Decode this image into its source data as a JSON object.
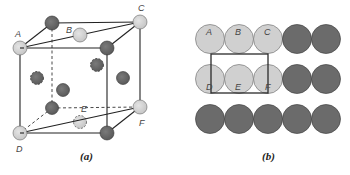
{
  "figure": {
    "panels": [
      {
        "id": "a",
        "caption": "(a)",
        "description": "Face-centered cubic unit cell with a diagonal plane through atoms A, B, C, D, E, F",
        "atom_labels": [
          "A",
          "B",
          "C",
          "D",
          "E",
          "F"
        ]
      },
      {
        "id": "b",
        "caption": "(b)",
        "description": "Atomic arrangement on the plane: three rows of five close-packed atoms with a rectangle outlining A, B, C, D, E, F",
        "grid": {
          "rows": 3,
          "cols": 5
        },
        "top_row_labels": [
          "A",
          "B",
          "C"
        ],
        "middle_row_labels": [
          "D",
          "E",
          "F"
        ]
      }
    ],
    "colors": {
      "highlighted_atom": "#d3d3d3",
      "other_atom": "#6b6b6b",
      "outline": "#2a2a2a"
    }
  }
}
